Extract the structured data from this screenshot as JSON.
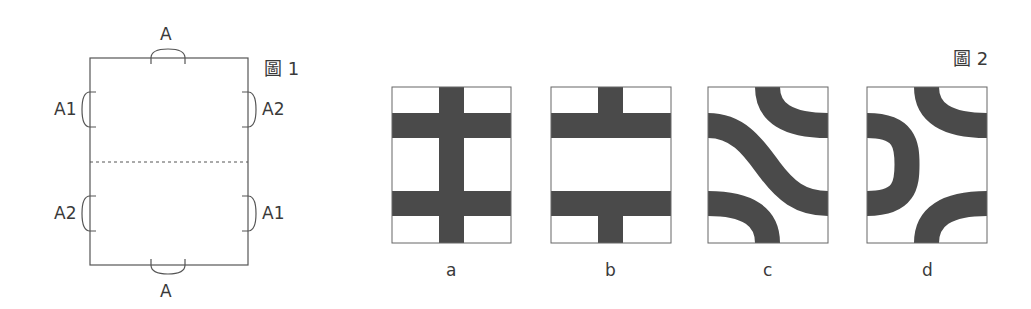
{
  "figure1": {
    "caption": "圖 1",
    "labels": {
      "top": "A",
      "bottom": "A",
      "left_upper": "A1",
      "left_lower": "A2",
      "right_upper": "A2",
      "right_lower": "A1"
    },
    "outline_color": "#555555",
    "dashed_fold_line": true
  },
  "figure2": {
    "caption": "圖 2",
    "tile_fill": "#4a4a4a",
    "panels": [
      {
        "label": "a",
        "pattern": "vertical bar with two horizontal bars (full cross)"
      },
      {
        "label": "b",
        "pattern": "two horizontal bars with vertical stubs top and bottom"
      },
      {
        "label": "c",
        "pattern": "S-curve with two corner arcs"
      },
      {
        "label": "d",
        "pattern": "left half-ring with two right corner arcs"
      }
    ]
  }
}
